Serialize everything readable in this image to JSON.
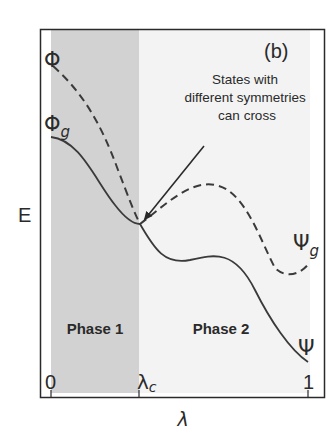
{
  "figure": {
    "panel_label": "(b)",
    "y_axis_label": "E",
    "x_axis_label": "λ",
    "x_ticks": [
      {
        "label": "0"
      },
      {
        "label": "λ",
        "sub": "c"
      },
      {
        "label": "1"
      }
    ],
    "regions": [
      {
        "name": "Phase 1",
        "color": "#d2d2d2",
        "text_color": "#f2f2f2"
      },
      {
        "name": "Phase 2",
        "color": "#f3f3f3",
        "text_color": "#2a2a2a"
      }
    ],
    "curves": {
      "phi": {
        "label": "Φ",
        "style": "dashed"
      },
      "phi_g": {
        "label": "Φ",
        "sub": "g",
        "style": "solid"
      },
      "psi_g": {
        "label": "Ψ",
        "sub": "g",
        "style": "dashed"
      },
      "psi": {
        "label": "Ψ",
        "style": "solid"
      }
    },
    "annotation": {
      "line1": "States with",
      "line2": "different symmetries",
      "line3": "can cross"
    },
    "colors": {
      "curve": "#3a3a3a",
      "frame": "#2a2a2a"
    }
  }
}
